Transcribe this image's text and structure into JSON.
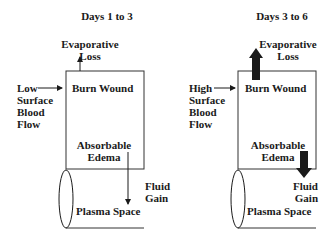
{
  "panels": [
    {
      "title": "Days 1 to 3",
      "top_label": [
        "Evaporative",
        "Loss"
      ],
      "left_label": [
        "Low",
        "Surface",
        "Blood",
        "Flow"
      ],
      "box_label": "Burn Wound",
      "inner_label": [
        "Absorbable",
        "Edema"
      ],
      "right_label": [
        "Fluid",
        "Gain"
      ],
      "bottom_label": "Plasma Space",
      "arrow_style": "thin"
    },
    {
      "title": "Days 3 to 6",
      "top_label": [
        "Evaporative",
        "Loss"
      ],
      "left_label": [
        "High",
        "Surface",
        "Blood",
        "Flow"
      ],
      "box_label": "Burn Wound",
      "inner_label": [
        "Absorbable",
        "Edema"
      ],
      "right_label": [
        "Fluid",
        "Gain"
      ],
      "bottom_label": "Plasma Space",
      "arrow_style": "thick"
    }
  ],
  "colors": {
    "ink": "#1a1a1a",
    "background": "#ffffff"
  }
}
